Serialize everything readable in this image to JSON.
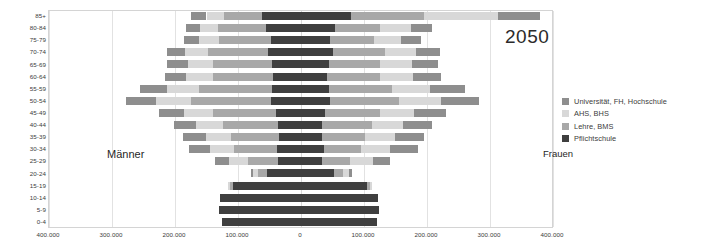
{
  "chart_data": {
    "type": "bar",
    "subtype": "population-pyramid-stacked",
    "title": "2050",
    "xlabel": "",
    "ylabel": "",
    "grid": true,
    "legend_position": "right",
    "xlim": [
      -400000,
      400000
    ],
    "x_ticks": [
      -400000,
      -300000,
      -200000,
      -100000,
      0,
      100000,
      200000,
      300000,
      400000
    ],
    "x_tick_labels": [
      "400.000",
      "300.000",
      "200.000",
      "100.000",
      "0",
      "100.000",
      "200.000",
      "300.000",
      "400.000"
    ],
    "side_labels": {
      "left": "Männer",
      "right": "Frauen"
    },
    "categories": [
      "85+",
      "80-84",
      "75-79",
      "70-74",
      "65-69",
      "60-64",
      "55-59",
      "50-54",
      "45-49",
      "40-44",
      "35-39",
      "30-34",
      "25-29",
      "20-24",
      "15-19",
      "10-14",
      "5-9",
      "0-4"
    ],
    "series": [
      {
        "name": "Pflichtschule",
        "color": "#3f3f3f"
      },
      {
        "name": "Lehre, BMS",
        "color": "#a8a8a8"
      },
      {
        "name": "AHS, BHS",
        "color": "#d8d8d8"
      },
      {
        "name": "Universität, FH, Hochschule",
        "color": "#8e8e8e"
      }
    ],
    "males": {
      "Pflichtschule": [
        62000,
        55000,
        48000,
        52000,
        46000,
        44000,
        46000,
        48000,
        40000,
        36000,
        35000,
        38000,
        36000,
        54000,
        108000,
        128000,
        130000,
        126000
      ],
      "Lehre, BMS": [
        60000,
        76000,
        82000,
        96000,
        94000,
        96000,
        116000,
        126000,
        100000,
        88000,
        76000,
        68000,
        48000,
        14000,
        5000,
        0,
        0,
        0
      ],
      "AHS, BHS": [
        28000,
        30000,
        32000,
        36000,
        40000,
        42000,
        50000,
        56000,
        46000,
        42000,
        40000,
        38000,
        30000,
        8000,
        3000,
        0,
        0,
        0
      ],
      "Universität, FH, Hochschule": [
        24000,
        22000,
        24000,
        28000,
        32000,
        34000,
        44000,
        48000,
        40000,
        36000,
        36000,
        34000,
        22000,
        4000,
        0,
        0,
        0,
        0
      ]
    },
    "females": {
      "Pflichtschule": [
        80000,
        54000,
        46000,
        50000,
        44000,
        42000,
        44000,
        46000,
        38000,
        34000,
        33000,
        36000,
        34000,
        52000,
        104000,
        122000,
        124000,
        120000
      ],
      "Lehre, BMS": [
        116000,
        72000,
        70000,
        84000,
        82000,
        84000,
        100000,
        110000,
        88000,
        78000,
        68000,
        60000,
        44000,
        14000,
        5000,
        0,
        0,
        0
      ],
      "AHS, BHS": [
        116000,
        48000,
        42000,
        48000,
        50000,
        52000,
        60000,
        66000,
        54000,
        50000,
        48000,
        46000,
        36000,
        10000,
        4000,
        0,
        0,
        0
      ],
      "Universität, FH, Hochschule": [
        68000,
        34000,
        32000,
        38000,
        42000,
        44000,
        56000,
        60000,
        50000,
        46000,
        46000,
        44000,
        28000,
        5000,
        0,
        0,
        0,
        0
      ]
    }
  },
  "legend": {
    "items": [
      {
        "label": "Universität, FH, Hochschule",
        "color": "#8e8e8e"
      },
      {
        "label": "AHS, BHS",
        "color": "#d8d8d8"
      },
      {
        "label": "Lehre, BMS",
        "color": "#a8a8a8"
      },
      {
        "label": "Pflichtschule",
        "color": "#3f3f3f"
      }
    ]
  }
}
